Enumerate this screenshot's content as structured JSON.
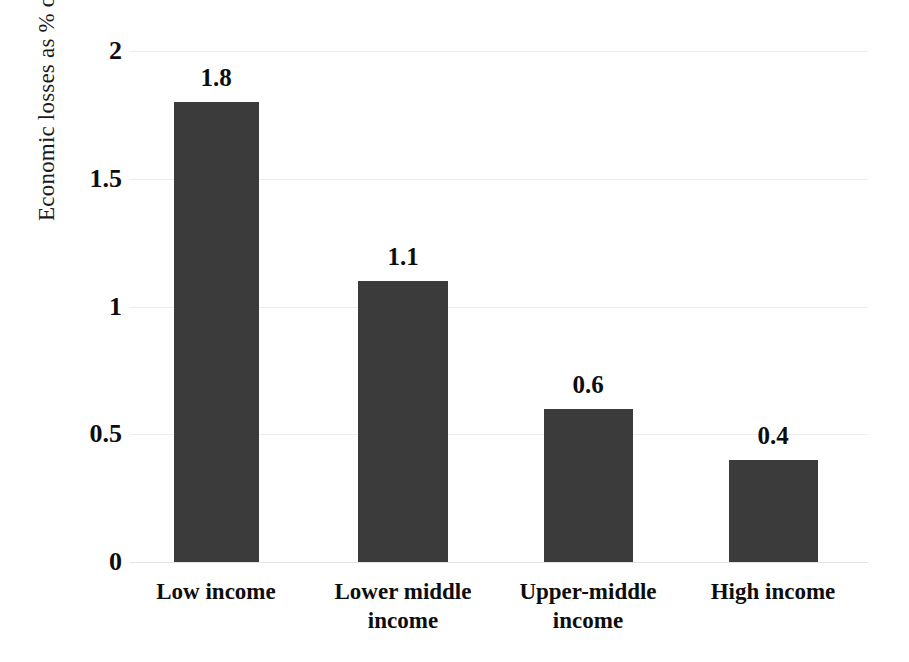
{
  "chart_data": {
    "type": "bar",
    "title": "",
    "xlabel": "",
    "ylabel": "Economic losses as % of GDP",
    "categories": [
      "Low income",
      "Lower middle income",
      "Upper-middle income",
      "High income"
    ],
    "category_lines": [
      [
        "Low income"
      ],
      [
        "Lower middle",
        "income"
      ],
      [
        "Upper-middle",
        "income"
      ],
      [
        "High income"
      ]
    ],
    "values": [
      1.8,
      1.1,
      0.6,
      0.4
    ],
    "value_labels": [
      "1.8",
      "1.1",
      "0.6",
      "0.4"
    ],
    "ylim": [
      0,
      2
    ],
    "yticks": [
      0,
      0.5,
      1,
      1.5,
      2
    ],
    "ytick_labels": [
      "0",
      "0.5",
      "1",
      "1.5",
      "2"
    ],
    "grid": true,
    "grid_axis": "y",
    "legend": false,
    "bar_color": "#3b3b3b",
    "grid_color": "#ededed",
    "text_color": "#0d0d0d",
    "background": "#ffffff"
  }
}
